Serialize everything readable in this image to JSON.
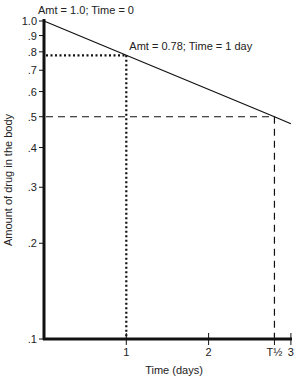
{
  "chart_data": {
    "type": "line",
    "title": "",
    "xlabel": "Time (days)",
    "ylabel": "Amount of drug in the body",
    "yscale": "log",
    "ylim": [
      0.1,
      1.0
    ],
    "xlim": [
      0,
      3
    ],
    "grid": false,
    "y_ticks": [
      {
        "value": 1.0,
        "label": "1.0"
      },
      {
        "value": 0.9,
        "label": ".9"
      },
      {
        "value": 0.8,
        "label": ".8"
      },
      {
        "value": 0.7,
        "label": ".7"
      },
      {
        "value": 0.6,
        "label": ".6"
      },
      {
        "value": 0.5,
        "label": ".5"
      },
      {
        "value": 0.4,
        "label": ".4"
      },
      {
        "value": 0.3,
        "label": ".3"
      },
      {
        "value": 0.2,
        "label": ".2"
      },
      {
        "value": 0.1,
        "label": ".1"
      }
    ],
    "x_ticks": [
      {
        "value": 1,
        "label": "1"
      },
      {
        "value": 2,
        "label": "2"
      },
      {
        "value": 2.8,
        "label": "T½"
      },
      {
        "value": 3,
        "label": "3"
      }
    ],
    "series": [
      {
        "name": "Drug amount",
        "x": [
          0,
          1,
          2.8,
          3.0
        ],
        "y": [
          1.0,
          0.78,
          0.5,
          0.475
        ]
      }
    ],
    "reference_lines": [
      {
        "style": "dotted",
        "description": "Amt 0.78 at Time 1 day",
        "x": 1,
        "y": 0.78
      },
      {
        "style": "dashed",
        "description": "Half amount at T½",
        "x": 2.8,
        "y": 0.5
      }
    ],
    "annotations": [
      {
        "text": "Amt = 1.0; Time = 0",
        "x": 0,
        "y": 1.0
      },
      {
        "text": "Amt = 0.78; Time = 1 day",
        "x": 1,
        "y": 0.78
      }
    ]
  }
}
